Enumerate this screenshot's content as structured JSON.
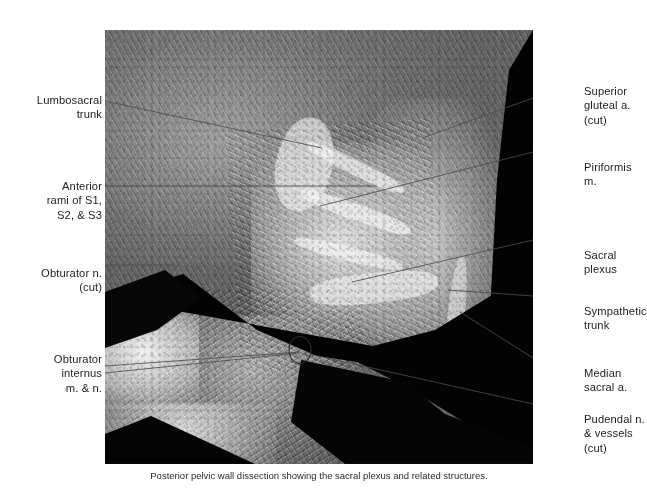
{
  "figure": {
    "kind": "anatomical-photograph",
    "subject": "Posterior pelvic wall dissection showing the sacral plexus",
    "modality": "grayscale cadaveric photograph",
    "caption": "Posterior pelvic wall dissection showing the sacral plexus and related structures."
  },
  "labels_left": [
    {
      "id": "lumbosacral-trunk",
      "text": "Lumbosacral\ntrunk"
    },
    {
      "id": "anterior-rami",
      "text": "Anterior\nrami of S1,\nS2, & S3"
    },
    {
      "id": "obturator-nerve",
      "text": "Obturator n.\n(cut)"
    },
    {
      "id": "obturator-internus",
      "text": "Obturator\ninternus\nm. & n."
    }
  ],
  "labels_right": [
    {
      "id": "superior-gluteal-artery",
      "text": "Superior\ngluteal a.\n(cut)"
    },
    {
      "id": "piriformis",
      "text": "Piriformis m."
    },
    {
      "id": "sacral-plexus",
      "text": "Sacral plexus"
    },
    {
      "id": "sympathetic-trunk",
      "text": "Sympathetic\ntrunk"
    },
    {
      "id": "median-sacral-artery",
      "text": "Median\nsacral a."
    },
    {
      "id": "pudendal",
      "text": "Pudendal n.\n& vessels\n(cut)"
    }
  ],
  "colors": {
    "page_background": "#ffffff",
    "leader_line": "#4c4c4c",
    "label_text": "#1d1d1d",
    "photo_dark": "#080808",
    "tissue_mid": "#7a756e"
  }
}
